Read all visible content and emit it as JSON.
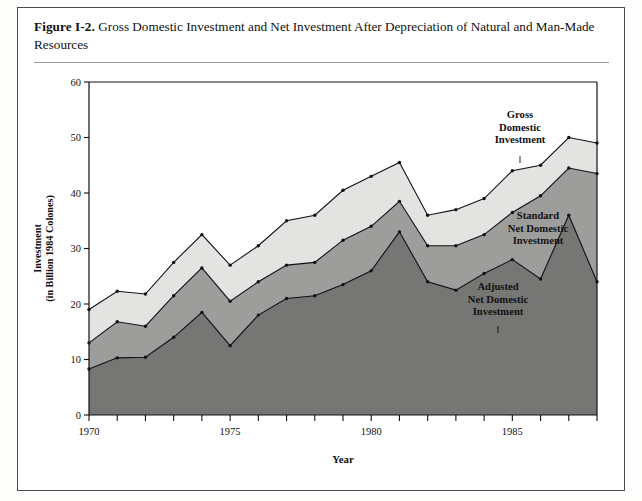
{
  "figure": {
    "number": "Figure I-2.",
    "title": "Gross Domestic Investment and Net Investment After Depreciation of Natural and Man-Made Resources"
  },
  "chart_data": {
    "type": "area",
    "stacked": false,
    "title": "Gross Domestic Investment and Net Investment After Depreciation of Natural and Man-Made Resources",
    "xlabel": "Year",
    "ylabel": "Investment (in Billion 1984 Colones)",
    "ylabel_line1": "Investment",
    "ylabel_line2": "(in Billion 1984 Colones)",
    "xlim": [
      1970,
      1988
    ],
    "ylim": [
      0,
      60
    ],
    "yticks": [
      0,
      10,
      20,
      30,
      40,
      50,
      60
    ],
    "xticks": [
      1970,
      1971,
      1972,
      1973,
      1974,
      1975,
      1976,
      1977,
      1978,
      1979,
      1980,
      1981,
      1982,
      1983,
      1984,
      1985,
      1986,
      1987,
      1988
    ],
    "xtick_labels": [
      "1970",
      "",
      "",
      "",
      "",
      "1975",
      "",
      "",
      "",
      "",
      "1980",
      "",
      "",
      "",
      "",
      "1985",
      "",
      "",
      ""
    ],
    "grid": false,
    "legend": "in-plot annotations",
    "x": [
      1970,
      1971,
      1972,
      1973,
      1974,
      1975,
      1976,
      1977,
      1978,
      1979,
      1980,
      1981,
      1982,
      1983,
      1984,
      1985,
      1986,
      1987,
      1988
    ],
    "series": [
      {
        "name": "Gross Domestic Investment",
        "color": "#e3e3e1",
        "values": [
          19.0,
          22.3,
          21.8,
          27.5,
          32.5,
          27.0,
          30.5,
          35.0,
          36.0,
          40.5,
          43.0,
          45.5,
          36.0,
          37.0,
          39.0,
          44.0,
          45.0,
          50.0,
          49.0
        ]
      },
      {
        "name": "Standard Net Domestic Investment",
        "color": "#9d9d9b",
        "values": [
          13.0,
          16.8,
          16.0,
          21.5,
          26.5,
          20.5,
          24.0,
          27.0,
          27.5,
          31.5,
          34.0,
          38.5,
          30.5,
          30.5,
          32.5,
          36.5,
          39.5,
          44.5,
          43.5
        ]
      },
      {
        "name": "Adjusted Net Domestic Investment",
        "color": "#767674",
        "values": [
          8.3,
          10.3,
          10.4,
          14.0,
          18.5,
          12.5,
          18.0,
          21.0,
          21.5,
          23.5,
          26.0,
          33.0,
          24.0,
          22.5,
          25.5,
          28.0,
          24.5,
          36.0,
          24.0
        ]
      }
    ],
    "annotations": [
      {
        "label": "Gross Domestic Investment",
        "lines": [
          "Gross",
          "Domestic",
          "Investment"
        ],
        "x": 520,
        "y": 118
      },
      {
        "label": "Standard Net Domestic Investment",
        "lines": [
          "Standard",
          "Net Domestic",
          "Investment"
        ],
        "x": 538,
        "y": 219
      },
      {
        "label": "Adjusted Net Domestic Investment",
        "lines": [
          "Adjusted",
          "Net Domestic",
          "Investment"
        ],
        "x": 498,
        "y": 290
      }
    ]
  }
}
